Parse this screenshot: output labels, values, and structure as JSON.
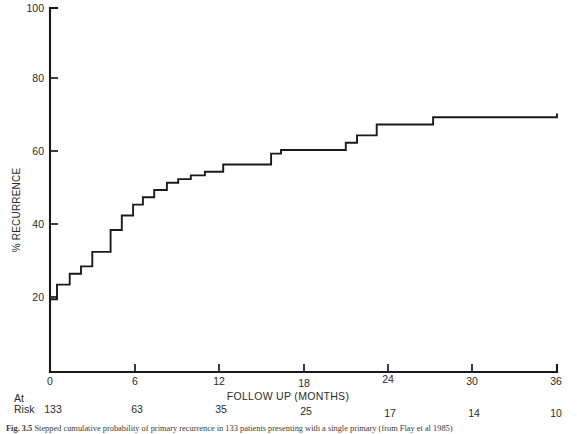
{
  "figure": {
    "caption_label": "Fig. 3.5",
    "caption_text": "Stepped cumulative probability of primary recurrence in 133 patients presenting with a single primary (from Flay et al 1985)"
  },
  "axes": {
    "y_title": "% RECURRENCE",
    "x_title": "FOLLOW UP (MONTHS)",
    "y_ticks": [
      "20",
      "40",
      "60",
      "80",
      "100"
    ],
    "x_ticks": [
      "0",
      "6",
      "12",
      "18",
      "24",
      "30",
      "36"
    ]
  },
  "at_risk": {
    "label_line1": "At",
    "label_line2": "Risk",
    "values": [
      "133",
      "63",
      "35",
      "25",
      "17",
      "14",
      "10"
    ]
  },
  "colors": {
    "curve": "#1a1a1a",
    "axis": "#1a1a1a",
    "text": "#2b2b2b",
    "background": "#ffffff"
  },
  "chart_data": {
    "type": "line",
    "subtype": "step",
    "title": "",
    "xlabel": "FOLLOW UP (MONTHS)",
    "ylabel": "% RECURRENCE",
    "xlim": [
      0,
      36
    ],
    "ylim": [
      0,
      100
    ],
    "xticks": [
      0,
      6,
      12,
      18,
      24,
      30,
      36
    ],
    "yticks": [
      0,
      20,
      40,
      60,
      80,
      100
    ],
    "grid": false,
    "legend": "none",
    "series": [
      {
        "name": "Cumulative % recurrence",
        "step": "post",
        "x": [
          0.0,
          0.5,
          0.5,
          1.4,
          1.4,
          2.2,
          2.2,
          3.0,
          3.0,
          4.3,
          4.3,
          5.1,
          5.1,
          5.9,
          5.9,
          6.6,
          6.6,
          7.4,
          7.4,
          8.3,
          8.3,
          9.1,
          9.1,
          10.0,
          10.0,
          11.0,
          11.0,
          12.3,
          12.3,
          15.7,
          15.7,
          16.4,
          16.4,
          21.0,
          21.0,
          21.8,
          21.8,
          23.2,
          23.2,
          27.2,
          27.2,
          36.0
        ],
        "y": [
          20,
          20,
          24,
          24,
          27,
          27,
          29,
          29,
          33,
          33,
          39,
          39,
          43,
          43,
          46,
          46,
          48,
          48,
          50,
          50,
          52,
          52,
          53,
          53,
          54,
          54,
          55,
          55,
          57,
          57,
          60,
          60,
          61,
          61,
          63,
          63,
          65,
          65,
          68,
          68,
          70,
          71
        ],
        "step_points": [
          {
            "month": 0.0,
            "percent": 20
          },
          {
            "month": 0.5,
            "percent": 24
          },
          {
            "month": 1.4,
            "percent": 27
          },
          {
            "month": 2.2,
            "percent": 29
          },
          {
            "month": 3.0,
            "percent": 33
          },
          {
            "month": 4.3,
            "percent": 39
          },
          {
            "month": 5.1,
            "percent": 43
          },
          {
            "month": 5.9,
            "percent": 46
          },
          {
            "month": 6.6,
            "percent": 48
          },
          {
            "month": 7.4,
            "percent": 50
          },
          {
            "month": 8.3,
            "percent": 52
          },
          {
            "month": 9.1,
            "percent": 53
          },
          {
            "month": 10.0,
            "percent": 54
          },
          {
            "month": 11.0,
            "percent": 55
          },
          {
            "month": 12.3,
            "percent": 57
          },
          {
            "month": 15.7,
            "percent": 60
          },
          {
            "month": 16.4,
            "percent": 61
          },
          {
            "month": 21.0,
            "percent": 63
          },
          {
            "month": 21.8,
            "percent": 65
          },
          {
            "month": 23.2,
            "percent": 68
          },
          {
            "month": 27.2,
            "percent": 70
          },
          {
            "month": 36.0,
            "percent": 71
          }
        ]
      }
    ],
    "at_risk_table": {
      "row_label": "At Risk",
      "months": [
        0,
        6,
        12,
        18,
        24,
        30,
        36
      ],
      "counts": [
        133,
        63,
        35,
        25,
        17,
        14,
        10
      ]
    }
  }
}
